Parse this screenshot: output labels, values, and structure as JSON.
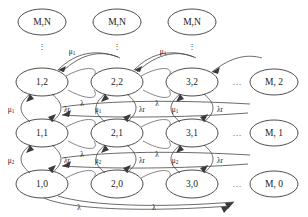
{
  "figure": {
    "kind": "markov-chain-state-transition-diagram",
    "background_color": "#ffffff",
    "node_stroke_color": "#3a3a3a",
    "edge_stroke_color": "#454545",
    "text_color": "#1c1c1c"
  },
  "nodes": {
    "top_row": [
      {
        "id": "top-1",
        "label": "M,N",
        "cx": 42,
        "cy": 22
      },
      {
        "id": "top-2",
        "label": "M,N",
        "cx": 117,
        "cy": 22
      },
      {
        "id": "top-3",
        "label": "M,N",
        "cx": 192,
        "cy": 22
      }
    ],
    "row_2": [
      {
        "id": "n-1-2",
        "label": "1,2",
        "cx": 42,
        "cy": 82
      },
      {
        "id": "n-2-2",
        "label": "2,2",
        "cx": 117,
        "cy": 82
      },
      {
        "id": "n-3-2",
        "label": "3,2",
        "cx": 192,
        "cy": 82
      }
    ],
    "row_1": [
      {
        "id": "n-1-1",
        "label": "1,1",
        "cx": 42,
        "cy": 133
      },
      {
        "id": "n-2-1",
        "label": "2,1",
        "cx": 117,
        "cy": 133
      },
      {
        "id": "n-3-1",
        "label": "3,1",
        "cx": 192,
        "cy": 133
      }
    ],
    "row_0": [
      {
        "id": "n-1-0",
        "label": "1,0",
        "cx": 42,
        "cy": 184
      },
      {
        "id": "n-2-0",
        "label": "2,0",
        "cx": 117,
        "cy": 184
      },
      {
        "id": "n-3-0",
        "label": "3,0",
        "cx": 192,
        "cy": 184
      }
    ],
    "right_column": [
      {
        "id": "n-M-2",
        "label": "M, 2",
        "cx": 274,
        "cy": 82
      },
      {
        "id": "n-M-1",
        "label": "M, 1",
        "cx": 274,
        "cy": 133
      },
      {
        "id": "n-M-0",
        "label": "M, 0",
        "cx": 274,
        "cy": 184
      }
    ]
  },
  "ellipsis": {
    "vertical_symbol": "⋮",
    "horizontal_symbol": "…",
    "vertical_positions": [
      {
        "id": "vdots-1",
        "cx": 42,
        "cy": 46
      },
      {
        "id": "vdots-2",
        "cx": 117,
        "cy": 46
      },
      {
        "id": "vdots-3",
        "cx": 192,
        "cy": 46
      }
    ],
    "horizontal_positions": [
      {
        "id": "hdots-row2",
        "cx": 237,
        "cy": 82
      },
      {
        "id": "hdots-row1",
        "cx": 237,
        "cy": 133
      },
      {
        "id": "hdots-row0",
        "cx": 237,
        "cy": 184
      }
    ]
  },
  "rate_labels": {
    "mu1": {
      "base": "μ",
      "sub": "1"
    },
    "mu2": {
      "base": "μ",
      "sub": "2"
    },
    "lr": {
      "base": "λr",
      "sub": ""
    },
    "lam": {
      "base": "λ",
      "sub": ""
    }
  },
  "edge_labels": [
    {
      "id": "mu1-top-left",
      "text": "μ1",
      "base": "μ",
      "sub": "1",
      "x": 72,
      "y": 52
    },
    {
      "id": "mu1-top-right",
      "text": "μ1",
      "base": "μ",
      "sub": "1",
      "x": 163,
      "y": 52
    },
    {
      "id": "mu1-left-col",
      "text": "μ1",
      "base": "μ",
      "sub": "1",
      "x": 12,
      "y": 110
    },
    {
      "id": "lr-r2-a",
      "text": "λr",
      "base": "λr",
      "sub": "",
      "x": 67,
      "y": 110
    },
    {
      "id": "lam-r2-a",
      "text": "λ",
      "base": "λ",
      "sub": "",
      "x": 82,
      "y": 104
    },
    {
      "id": "mu1-r2-a",
      "text": "μ1",
      "base": "μ",
      "sub": "1",
      "x": 97,
      "y": 110
    },
    {
      "id": "lr-r2-b",
      "text": "λr",
      "base": "λr",
      "sub": "",
      "x": 142,
      "y": 110
    },
    {
      "id": "lam-r2-b",
      "text": "λ",
      "base": "λ",
      "sub": "",
      "x": 157,
      "y": 104
    },
    {
      "id": "mu1-r2-b",
      "text": "μ1",
      "base": "μ",
      "sub": "1",
      "x": 174,
      "y": 110
    },
    {
      "id": "lr-r2-c",
      "text": "λr",
      "base": "λr",
      "sub": "",
      "x": 220,
      "y": 110
    },
    {
      "id": "mu2-left-col",
      "text": "μ2",
      "base": "μ",
      "sub": "2",
      "x": 12,
      "y": 161
    },
    {
      "id": "lr-r1-a",
      "text": "λr",
      "base": "λr",
      "sub": "",
      "x": 67,
      "y": 161
    },
    {
      "id": "lam-r1-a",
      "text": "λ",
      "base": "λ",
      "sub": "",
      "x": 82,
      "y": 155
    },
    {
      "id": "mu2-r1-a",
      "text": "μ2",
      "base": "μ",
      "sub": "2",
      "x": 97,
      "y": 161
    },
    {
      "id": "lr-r1-b",
      "text": "λr",
      "base": "λr",
      "sub": "",
      "x": 142,
      "y": 161
    },
    {
      "id": "lam-r1-b",
      "text": "λ",
      "base": "λ",
      "sub": "",
      "x": 157,
      "y": 155
    },
    {
      "id": "mu2-r1-b",
      "text": "μ2",
      "base": "μ",
      "sub": "2",
      "x": 174,
      "y": 161
    },
    {
      "id": "lr-r1-c",
      "text": "λr",
      "base": "λr",
      "sub": "",
      "x": 220,
      "y": 161
    },
    {
      "id": "lam-bottom-a",
      "text": "λ",
      "base": "λ",
      "sub": "",
      "x": 79,
      "y": 208
    },
    {
      "id": "lam-bottom-b",
      "text": "λ",
      "base": "λ",
      "sub": "",
      "x": 154,
      "y": 208
    }
  ]
}
